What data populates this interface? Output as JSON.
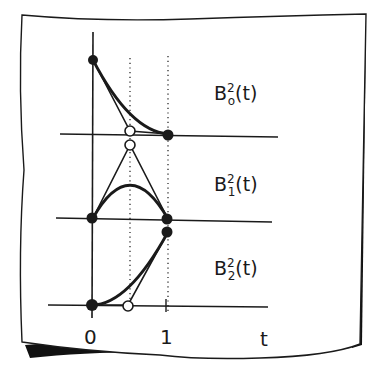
{
  "diagram": {
    "colors": {
      "ink": "#1a1a1a",
      "paper": "#ffffff",
      "shadow": "#111111"
    },
    "axis": {
      "x_label": "t",
      "ticks": [
        {
          "value": "0"
        },
        {
          "value": "1"
        }
      ]
    },
    "panels": [
      {
        "id": "b0",
        "base": "B",
        "superscript": "2",
        "subscript": "o",
        "argument": "(t)",
        "control_points": [
          [
            0,
            1
          ],
          [
            0.5,
            0
          ],
          [
            1,
            0
          ]
        ],
        "open_control_points": [
          [
            0.5,
            0
          ]
        ]
      },
      {
        "id": "b1",
        "base": "B",
        "superscript": "2",
        "subscript": "1",
        "argument": "(t)",
        "control_points": [
          [
            0,
            0
          ],
          [
            0.5,
            1
          ],
          [
            1,
            0
          ]
        ],
        "open_control_points": [
          [
            0.5,
            1
          ]
        ]
      },
      {
        "id": "b2",
        "base": "B",
        "superscript": "2",
        "subscript": "2",
        "argument": "(t)",
        "control_points": [
          [
            0,
            0
          ],
          [
            0.5,
            0
          ],
          [
            1,
            1
          ]
        ],
        "open_control_points": [
          [
            0.5,
            0
          ]
        ]
      }
    ]
  }
}
